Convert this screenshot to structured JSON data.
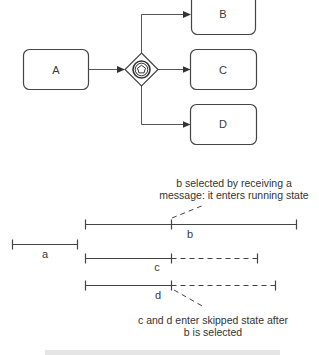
{
  "diagram": {
    "process": {
      "tasks": [
        {
          "id": "A",
          "label": "A"
        },
        {
          "id": "B",
          "label": "B"
        },
        {
          "id": "C",
          "label": "C"
        },
        {
          "id": "D",
          "label": "D"
        }
      ],
      "gateway": {
        "type": "event-based-gateway",
        "icon": "pentagon-in-double-circle-icon"
      },
      "flows": [
        {
          "from": "A",
          "to": "gateway"
        },
        {
          "from": "gateway",
          "to": "B"
        },
        {
          "from": "gateway",
          "to": "C"
        },
        {
          "from": "gateway",
          "to": "D"
        }
      ]
    },
    "timeline": {
      "bars": [
        {
          "id": "a",
          "label": "a",
          "segments": [
            "solid"
          ]
        },
        {
          "id": "b",
          "label": "b",
          "segments": [
            "solid",
            "solid"
          ]
        },
        {
          "id": "c",
          "label": "c",
          "segments": [
            "solid",
            "dashed"
          ]
        },
        {
          "id": "d",
          "label": "d",
          "segments": [
            "solid",
            "dashed"
          ]
        }
      ],
      "annotations": {
        "top": {
          "line1": "b selected by receiving a",
          "line2": "message: it enters running state"
        },
        "bottom": {
          "line1": "c and d enter skipped state after",
          "line2": "b is selected"
        }
      }
    },
    "colors": {
      "stroke": "#444444",
      "text": "#333333",
      "background": "#ffffff"
    }
  }
}
